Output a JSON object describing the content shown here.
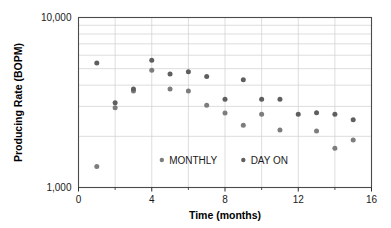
{
  "chart_data": {
    "type": "scatter",
    "title": "",
    "xlabel": "Time (months)",
    "ylabel": "Producing Rate (BOPM)",
    "xlim": [
      0,
      16
    ],
    "ylim": [
      1000,
      10000
    ],
    "yscale": "log",
    "xscale": "linear",
    "grid": true,
    "xticks": [
      0,
      4,
      8,
      12,
      16
    ],
    "xtick_labels": [
      "0",
      "4",
      "8",
      "12",
      "16"
    ],
    "xticks_minor": [
      2,
      6,
      10,
      14
    ],
    "yticks": [
      1000,
      10000
    ],
    "ytick_labels": [
      "1,000",
      "10,000"
    ],
    "yticks_minor": [
      2000,
      3000,
      4000,
      5000,
      6000,
      7000,
      8000,
      9000
    ],
    "legend_position": "inside-bottom-center",
    "marker_color": "#6e6e6e",
    "marker_size": 5,
    "series": [
      {
        "name": "MONTHLY",
        "color": "#7d7d7d",
        "points": [
          {
            "x": 1,
            "y": 1330
          },
          {
            "x": 2,
            "y": 2950
          },
          {
            "x": 3,
            "y": 3700
          },
          {
            "x": 4,
            "y": 4900
          },
          {
            "x": 5,
            "y": 3800
          },
          {
            "x": 6,
            "y": 3700
          },
          {
            "x": 7,
            "y": 3050
          },
          {
            "x": 8,
            "y": 2740
          },
          {
            "x": 9,
            "y": 2320
          },
          {
            "x": 10,
            "y": 2700
          },
          {
            "x": 11,
            "y": 2180
          },
          {
            "x": 13,
            "y": 2150
          },
          {
            "x": 14,
            "y": 1700
          },
          {
            "x": 15,
            "y": 1900
          }
        ]
      },
      {
        "name": "DAY ON",
        "color": "#5f5f5f",
        "points": [
          {
            "x": 1,
            "y": 5400
          },
          {
            "x": 2,
            "y": 3150
          },
          {
            "x": 3,
            "y": 3800
          },
          {
            "x": 4,
            "y": 5600
          },
          {
            "x": 5,
            "y": 4650
          },
          {
            "x": 6,
            "y": 4800
          },
          {
            "x": 7,
            "y": 4500
          },
          {
            "x": 8,
            "y": 3300
          },
          {
            "x": 9,
            "y": 4300
          },
          {
            "x": 10,
            "y": 3300
          },
          {
            "x": 11,
            "y": 3300
          },
          {
            "x": 12,
            "y": 2700
          },
          {
            "x": 13,
            "y": 2750
          },
          {
            "x": 14,
            "y": 2700
          },
          {
            "x": 15,
            "y": 2500
          }
        ]
      }
    ]
  },
  "legend": {
    "items": [
      {
        "label": "MONTHLY",
        "marker": "circle-marker"
      },
      {
        "label": "DAY ON",
        "marker": "circle-marker"
      }
    ]
  }
}
